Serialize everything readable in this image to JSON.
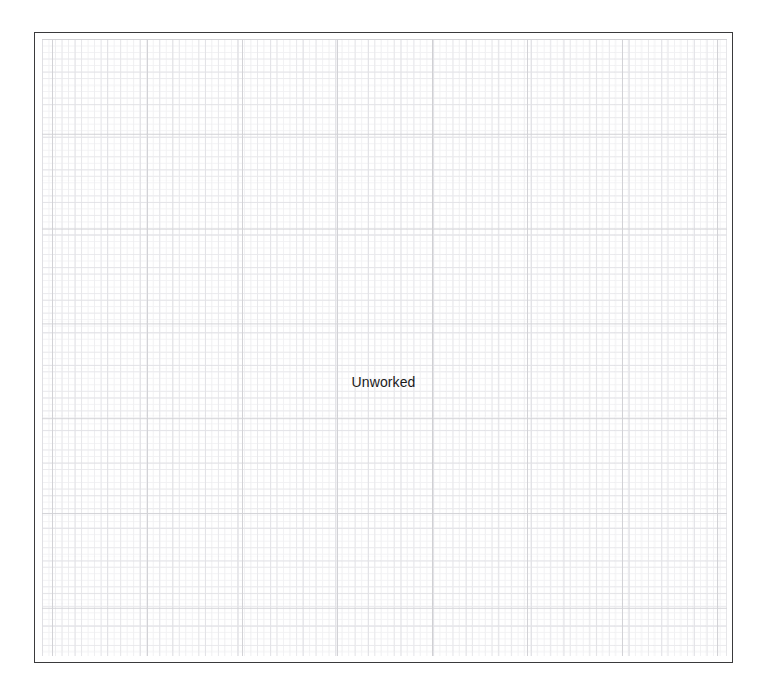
{
  "page": {
    "background_color": "#ffffff",
    "width": 757,
    "height": 693
  },
  "canvas": {
    "name": "graph-paper-canvas",
    "border_color": "#3a3a3c",
    "background_color": "#ffffff",
    "label": "Unworked",
    "label_color": "#1a1a1a",
    "bounds": {
      "left": 34,
      "top": 32,
      "width": 699,
      "height": 631
    }
  },
  "grid": {
    "minor_color": "#f1f1f3",
    "medium_color": "#e9e9ec",
    "sub_major_color": "#e2e2e6",
    "major_color": "#d2d2d6",
    "minor_spacing_px": 6.5,
    "medium_spacing_px": 19.5,
    "sub_major_spacing_px": 32.6,
    "major_spacing_px": 95
  }
}
